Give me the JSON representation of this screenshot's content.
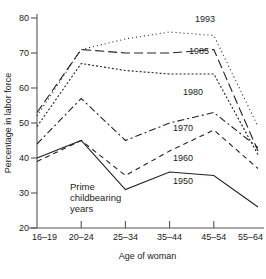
{
  "chart_data": {
    "type": "line",
    "title": "",
    "xlabel": "Age of woman",
    "ylabel": "Percentage in labor force",
    "categories": [
      "16–19",
      "20–24",
      "25–34",
      "35–44",
      "45–54",
      "55–64"
    ],
    "ylim": [
      20,
      80
    ],
    "yticks": [
      20,
      30,
      40,
      50,
      60,
      70,
      80
    ],
    "grid": false,
    "legend_position": "inline-right",
    "series": [
      {
        "name": "1993",
        "values": [
          52,
          71,
          74,
          76,
          75,
          49
        ],
        "dash": "1,3",
        "label_x": 205,
        "label_y": 22
      },
      {
        "name": "1985",
        "values": [
          53,
          71,
          70,
          70,
          71,
          42
        ],
        "dash": "9,4",
        "label_x": 199,
        "label_y": 54
      },
      {
        "name": "1980",
        "values": [
          49,
          67,
          65,
          64,
          64,
          41
        ],
        "dash": "2,2",
        "label_x": 193,
        "label_y": 95
      },
      {
        "name": "1970",
        "values": [
          44,
          57,
          45,
          50,
          53,
          43
        ],
        "dash": "7,3,2,3",
        "label_x": 183,
        "label_y": 131
      },
      {
        "name": "1960",
        "values": [
          39,
          45,
          35,
          42,
          48,
          37
        ],
        "dash": "5,4",
        "label_x": 183,
        "label_y": 161
      },
      {
        "name": "1950",
        "values": [
          40,
          45,
          31,
          36,
          35,
          26
        ],
        "dash": "0",
        "label_x": 183,
        "label_y": 184
      }
    ],
    "annotations": [
      {
        "name": "prime-childbearing-years",
        "lines": [
          "Prime",
          "childbearing",
          "years"
        ],
        "x": 70,
        "y": 190
      }
    ]
  },
  "axis": {
    "y_tick_labels": [
      "80",
      "70",
      "60",
      "50",
      "40",
      "30",
      "20"
    ],
    "x_tick_labels": [
      "16–19",
      "20–24",
      "25–34",
      "35–44",
      "45–54",
      "55–64"
    ],
    "y_title": "Percentage in labor force",
    "x_title": "Age of woman"
  },
  "colors": {
    "axis": "#555555",
    "line": "#222222",
    "text": "#1a1a1a",
    "background": "#ffffff"
  }
}
